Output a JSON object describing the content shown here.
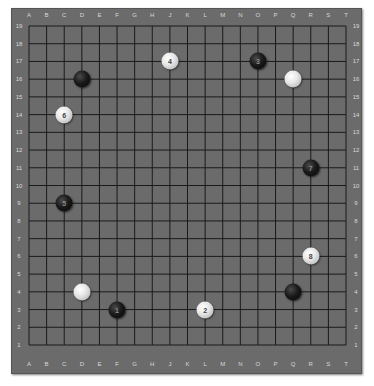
{
  "board": {
    "size": 19,
    "columns": [
      "A",
      "B",
      "C",
      "D",
      "E",
      "F",
      "G",
      "H",
      "J",
      "K",
      "L",
      "M",
      "N",
      "O",
      "P",
      "Q",
      "R",
      "S",
      "T"
    ],
    "rows": [
      19,
      18,
      17,
      16,
      15,
      14,
      13,
      12,
      11,
      10,
      9,
      8,
      7,
      6,
      5,
      4,
      3,
      2,
      1
    ],
    "colors": {
      "board": "#6b6b6b",
      "line": "#1a1a1a",
      "coord_text": "#d8d8d8"
    }
  },
  "stones": [
    {
      "color": "black",
      "point": "F3",
      "label": "1"
    },
    {
      "color": "white",
      "point": "L3",
      "label": "2"
    },
    {
      "color": "black",
      "point": "O17",
      "label": "3"
    },
    {
      "color": "white",
      "point": "J17",
      "label": "4"
    },
    {
      "color": "black",
      "point": "C9",
      "label": "5"
    },
    {
      "color": "white",
      "point": "C14",
      "label": "6"
    },
    {
      "color": "black",
      "point": "R11",
      "label": "7"
    },
    {
      "color": "white",
      "point": "R6",
      "label": "8"
    },
    {
      "color": "black",
      "point": "D16",
      "label": ""
    },
    {
      "color": "white",
      "point": "Q16",
      "label": ""
    },
    {
      "color": "black",
      "point": "Q4",
      "label": ""
    },
    {
      "color": "white",
      "point": "D4",
      "label": ""
    }
  ]
}
